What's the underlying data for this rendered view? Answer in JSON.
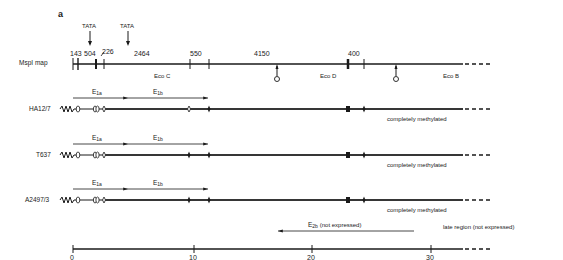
{
  "figure": {
    "panel_label": "a",
    "tata_labels": [
      "TATA",
      "TATA"
    ],
    "map": {
      "label": "MspI map",
      "fragment_sizes": [
        "143",
        "504",
        "226",
        "2464",
        "550",
        "4150",
        "400"
      ],
      "eco_fragments": [
        "Eco C",
        "Eco D",
        "Eco B"
      ]
    },
    "transcripts": {
      "e1a": {
        "main": "E",
        "sub": "1a"
      },
      "e1b": {
        "main": "E",
        "sub": "1b"
      },
      "e2b": {
        "main": "E",
        "sub": "2b",
        "note": "(not expressed)"
      }
    },
    "cell_lines": [
      {
        "name": "HA12/7",
        "status": "completely methylated"
      },
      {
        "name": "T637",
        "status": "completely methylated"
      },
      {
        "name": "A2497/3",
        "status": "completely methylated"
      }
    ],
    "late_region": "late region (not expressed)",
    "scale": {
      "ticks": [
        "0",
        "10",
        "20",
        "30"
      ]
    }
  }
}
